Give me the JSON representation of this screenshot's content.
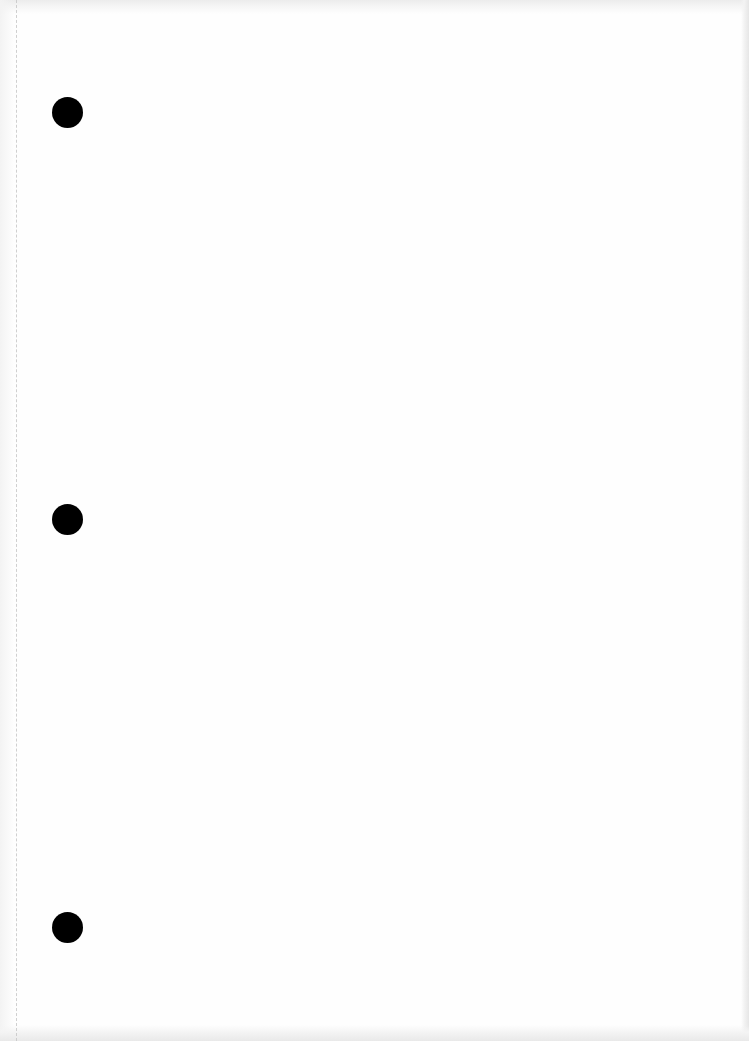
{
  "document": {
    "type": "blank scanned page",
    "text_content": "",
    "punch_holes": {
      "count": 3,
      "side": "left"
    },
    "perforation_line": {
      "side": "left",
      "style": "dashed"
    }
  },
  "colors": {
    "paper": "#fefefe",
    "punch_hole": "#000000",
    "scan_edge_shadow": "#e6e6e6",
    "perforation": "#c8c8c8"
  }
}
